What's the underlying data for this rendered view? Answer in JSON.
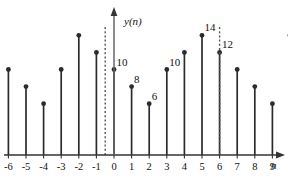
{
  "figure": {
    "y_axis_title": "y(n)",
    "x_axis_title": "n",
    "background": "#ffffff",
    "stem_color": "#2b2b2b",
    "dash_color": "#555555"
  },
  "chart_data": {
    "type": "bar",
    "title": "",
    "subtitle": "",
    "xlabel": "n",
    "ylabel": "y(n)",
    "grid": false,
    "legend": "none",
    "style": "stem",
    "xlim": [
      -7,
      12
    ],
    "ylim": [
      0,
      16
    ],
    "x": [
      -6,
      -5,
      -4,
      -3,
      -2,
      -1,
      0,
      1,
      2,
      3,
      4,
      5,
      6,
      7,
      8,
      9,
      10,
      11
    ],
    "values": [
      10,
      8,
      6,
      10,
      14,
      12,
      10,
      8,
      6,
      10,
      12,
      14,
      12,
      10,
      8,
      6,
      14,
      12
    ],
    "tick_labels": [
      "-6",
      "-5",
      "-4",
      "-3",
      "-2",
      "-1",
      "0",
      "1",
      "2",
      "3",
      "4",
      "5",
      "6",
      "7",
      "8",
      "9"
    ],
    "tick_values": [
      -6,
      -5,
      -4,
      -3,
      -2,
      -1,
      0,
      1,
      2,
      3,
      4,
      5,
      6,
      7,
      8,
      9
    ],
    "annotations": [
      {
        "x": 0,
        "value": 10,
        "text": "10"
      },
      {
        "x": 1,
        "value": 8,
        "text": "8"
      },
      {
        "x": 2,
        "value": 6,
        "text": "6"
      },
      {
        "x": 3,
        "value": 10,
        "text": "10"
      },
      {
        "x": 5,
        "value": 14,
        "text": "14"
      },
      {
        "x": 6,
        "value": 12,
        "text": "12"
      }
    ],
    "markers": [
      {
        "type": "vertical-dashed",
        "x": -0.5,
        "label": ""
      },
      {
        "type": "vertical-dashed",
        "x": 6.0,
        "label": ""
      }
    ]
  }
}
